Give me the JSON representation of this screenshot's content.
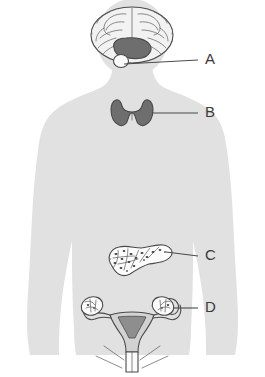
{
  "figure": {
    "type": "anatomical-diagram",
    "view": "anterior-body-silhouette",
    "background_color": "#ffffff",
    "body_color": "#e1e1e1",
    "outline_color": "#4a4a4a",
    "label_color": "#3a3a3a",
    "organ_fill_dark": "#6e6e6e",
    "organ_fill_light": "#fdfdfd"
  },
  "labels": [
    {
      "id": "A",
      "text": "A",
      "organ_name": "hypothalamus-pituitary",
      "x": 205,
      "y": 60
    },
    {
      "id": "B",
      "text": "B",
      "organ_name": "thyroid-gland",
      "x": 205,
      "y": 113
    },
    {
      "id": "C",
      "text": "C",
      "organ_name": "pancreas",
      "x": 205,
      "y": 256
    },
    {
      "id": "D",
      "text": "D",
      "organ_name": "ovary",
      "x": 205,
      "y": 308
    }
  ],
  "organs": [
    {
      "name": "brain",
      "label_ref": "A"
    },
    {
      "name": "hypothalamus",
      "label_ref": "A"
    },
    {
      "name": "pituitary-gland",
      "label_ref": "A"
    },
    {
      "name": "thyroid-gland",
      "label_ref": "B"
    },
    {
      "name": "pancreas",
      "label_ref": "C"
    },
    {
      "name": "uterus",
      "label_ref": "D"
    },
    {
      "name": "fallopian-tube",
      "label_ref": "D"
    },
    {
      "name": "ovary",
      "label_ref": "D"
    }
  ]
}
